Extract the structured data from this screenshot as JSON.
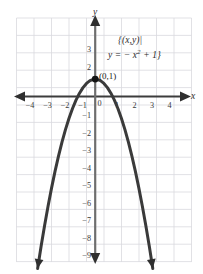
{
  "figure": {
    "axis_labels": {
      "x": "x",
      "y": "y"
    },
    "point_label": "(0,1)",
    "set_notation": {
      "line1": "{(x,y)|",
      "line2_prefix": "y = − x",
      "line2_exponent": "2",
      "line2_suffix": " + 1}"
    },
    "colors": {
      "grid": "#d9d9de",
      "axis": "#3c3c3c",
      "curve": "#3a3a3a",
      "background": "#ffffff",
      "point": "#141414"
    }
  },
  "chart_data": {
    "type": "line",
    "title": "",
    "subtitle": "",
    "equation": "y = -x^2 + 1",
    "xlabel": "x",
    "ylabel": "y",
    "xlim": [
      -4.6,
      4.6
    ],
    "ylim": [
      -9.9,
      3.9
    ],
    "grid": true,
    "legend": null,
    "x_ticks": [
      -4,
      -3,
      -2,
      -1,
      0,
      1,
      2,
      3,
      4
    ],
    "x_tick_labels": [
      "−4",
      "−3",
      "−2",
      "−1",
      "0",
      "1",
      "2",
      "3",
      "4"
    ],
    "y_ticks": [
      3,
      2,
      -1,
      -2,
      -3,
      -4,
      -5,
      -6,
      -7,
      -8,
      -9
    ],
    "y_tick_labels": [
      "3",
      "2",
      "−1",
      "−2",
      "−3",
      "−4",
      "−5",
      "−6",
      "−7",
      "−8",
      "−9"
    ],
    "annotations": [
      {
        "text": "(0,1)",
        "x": 0,
        "y": 1,
        "kind": "point-label"
      },
      {
        "text": "{(x,y)| y = − x² + 1}",
        "x": 2.6,
        "y": 3.2,
        "kind": "set-builder"
      }
    ],
    "marked_points": [
      {
        "x": 0,
        "y": 1,
        "label": "(0,1)"
      }
    ],
    "series": [
      {
        "name": "y = -x^2 + 1",
        "x": [
          -3.3,
          -3.1,
          -2.9,
          -2.7,
          -2.5,
          -2.3,
          -2.1,
          -1.9,
          -1.7,
          -1.5,
          -1.3,
          -1.1,
          -0.9,
          -0.7,
          -0.5,
          -0.3,
          -0.1,
          0,
          0.1,
          0.3,
          0.5,
          0.7,
          0.9,
          1.1,
          1.3,
          1.5,
          1.7,
          1.9,
          2.1,
          2.3,
          2.5,
          2.7,
          2.9,
          3.1,
          3.3
        ],
        "y": [
          -9.89,
          -8.61,
          -7.41,
          -6.29,
          -5.25,
          -4.29,
          -3.41,
          -2.61,
          -1.89,
          -1.25,
          -0.69,
          -0.21,
          0.19,
          0.51,
          0.75,
          0.91,
          0.99,
          1,
          0.99,
          0.91,
          0.75,
          0.51,
          0.19,
          -0.21,
          -0.69,
          -1.25,
          -1.89,
          -2.61,
          -3.41,
          -4.29,
          -5.25,
          -6.29,
          -7.41,
          -8.61,
          -9.89
        ]
      }
    ]
  }
}
